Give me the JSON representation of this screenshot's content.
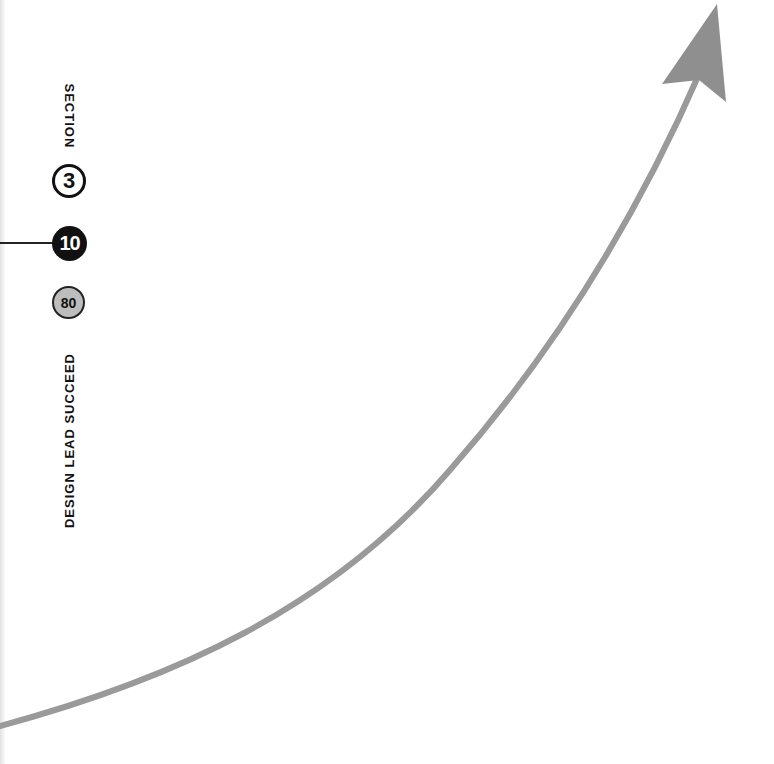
{
  "labels": {
    "section": "SECTION",
    "tagline": "DESIGN LEAD SUCCEED"
  },
  "badges": [
    {
      "value": "3",
      "style": "outline"
    },
    {
      "value": "10",
      "style": "solid"
    },
    {
      "value": "80",
      "style": "gray"
    }
  ],
  "colors": {
    "arrow": "#9a9a9a",
    "ink": "#111111",
    "badge_gray": "#bdbdbd"
  }
}
